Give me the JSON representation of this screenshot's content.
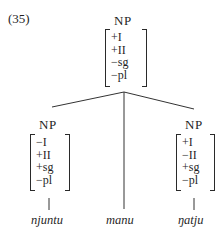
{
  "example_number": "(35)",
  "tree": {
    "root": {
      "label": "NP",
      "features": [
        "+I",
        "+II",
        "−sg",
        "−pl"
      ]
    },
    "children": [
      {
        "label": "NP",
        "features": [
          "−I",
          "+II",
          "+sg",
          "−pl"
        ],
        "word": "njuntu"
      },
      {
        "label": "",
        "features": [],
        "word": "manu"
      },
      {
        "label": "NP",
        "features": [
          "+I",
          "−II",
          "+sg",
          "−pl"
        ],
        "word": "ŋatju"
      }
    ]
  }
}
